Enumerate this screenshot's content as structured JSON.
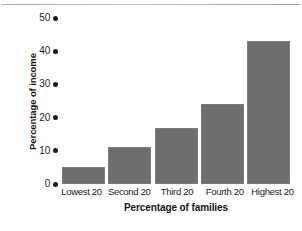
{
  "chart_data": {
    "type": "bar",
    "title": "",
    "xlabel": "Percentage of families",
    "ylabel": "Percentage of income",
    "categories": [
      "Lowest 20",
      "Second 20",
      "Third 20",
      "Fourth 20",
      "Highest 20"
    ],
    "values": [
      5,
      11,
      17,
      24,
      43
    ],
    "ylim": [
      0,
      50
    ],
    "yticks": [
      50,
      40,
      30,
      20,
      10,
      0
    ],
    "ytick_labels": [
      "50",
      "40",
      "30",
      "20",
      "10",
      "0"
    ],
    "grid": false,
    "legend": null,
    "bar_color": "#6e6e6e",
    "tick_marker": "dot",
    "axis_text_color": "#1b1b1b"
  }
}
